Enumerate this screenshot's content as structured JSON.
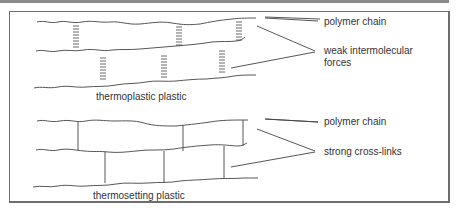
{
  "diagrams": [
    {
      "caption": "thermoplastic plastic",
      "labels": {
        "chain": "polymer chain",
        "bonds_line1": "weak intermolecular",
        "bonds_line2": "forces"
      },
      "bond_type": "dashed-ladder"
    },
    {
      "caption": "thermosetting plastic",
      "labels": {
        "chain": "polymer chain",
        "bonds": "strong cross-links"
      },
      "bond_type": "solid-line"
    }
  ],
  "colors": {
    "line": "#444444",
    "text": "#333333",
    "frame": "#6e6e6e"
  }
}
